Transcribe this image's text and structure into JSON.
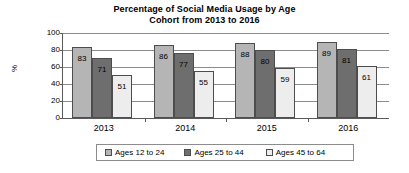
{
  "chart_data": {
    "type": "bar",
    "title": "Percentage of Social Media Usage by Age Cohort from 2013 to 2016",
    "title_line1": "Percentage of Social Media Usage by Age",
    "title_line2": "Cohort from 2013 to 2016",
    "xlabel": "",
    "ylabel": "%",
    "ylim": [
      0,
      100
    ],
    "yticks": [
      0,
      20,
      40,
      60,
      80,
      100
    ],
    "ytick_labels": [
      "0",
      "20",
      "40",
      "60",
      "80",
      "100"
    ],
    "grid": true,
    "legend_position": "bottom",
    "categories": [
      "2013",
      "2014",
      "2015",
      "2016"
    ],
    "series": [
      {
        "name": "Ages 12 to 24",
        "color": "#b5b5b5",
        "values": [
          83,
          86,
          88,
          89
        ],
        "labels": [
          "83",
          "86",
          "88",
          "89"
        ]
      },
      {
        "name": "Ages 25 to 44",
        "color": "#6e6e6e",
        "values": [
          71,
          77,
          80,
          81
        ],
        "labels": [
          "71",
          "77",
          "80",
          "81"
        ]
      },
      {
        "name": "Ages 45 to 64",
        "color": "#ededed",
        "values": [
          51,
          55,
          59,
          61
        ],
        "labels": [
          "51",
          "55",
          "59",
          "61"
        ]
      }
    ]
  }
}
